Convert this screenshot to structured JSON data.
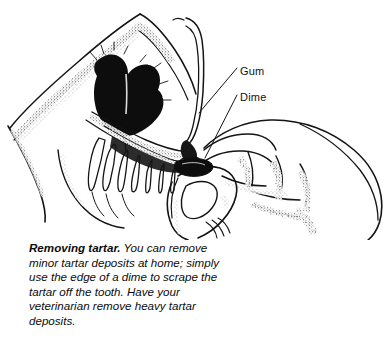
{
  "figure": {
    "style": "black-and-white-pen-and-ink-line-drawing",
    "background_color": "#ffffff",
    "ink_color": "#111111"
  },
  "illustration": {
    "description": "Side view of a dog's muzzle with the upper lip lifted by a finger, exposing the gum line and a row of teeth, while a human hand holds a dime against a tooth to scrape tartar.",
    "elements": [
      "dog-muzzle",
      "dog-nose",
      "dog-upper-lip",
      "dog-gum",
      "dog-teeth",
      "lip-retracting-finger",
      "human-hand",
      "dime"
    ]
  },
  "labels": [
    {
      "id": "gum",
      "text": "Gum"
    },
    {
      "id": "dime",
      "text": "Dime"
    }
  ],
  "caption": {
    "lead_in": "Removing tartar.",
    "body": " You can remove minor tartar deposits at home; simply use the edge of a dime to scrape the tartar off the tooth. Have your veterinarian remove heavy tartar deposits.",
    "lines": [
      "Removing tartar. You can remove",
      "minor tartar deposits at home; simply",
      "use the edge of a dime to scrape the",
      "tartar off the tooth. Have your veteri-",
      "narian remove heavy tartar deposits."
    ]
  }
}
